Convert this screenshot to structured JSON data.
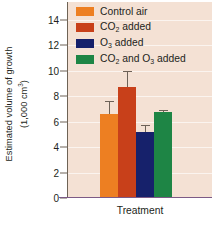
{
  "chart_data": {
    "type": "bar",
    "title": "",
    "xlabel": "Treatment",
    "ylabel_line1": "Estimated volume of growth",
    "ylabel_line2": "(1,000 cm3)",
    "ylabel_full": "Estimated volume of growth (1,000 cm³)",
    "categories": [
      "Control air",
      "CO2 added",
      "O3 added",
      "CO2 and O3 added"
    ],
    "values": [
      6.6,
      8.7,
      5.2,
      6.75
    ],
    "errors": [
      1.0,
      1.3,
      0.55,
      0.2
    ],
    "colors": [
      "#ED7F22",
      "#C8401A",
      "#16216B",
      "#1E8545"
    ],
    "ylim": [
      0,
      15.4
    ],
    "yticks": [
      0,
      2,
      4,
      6,
      8,
      10,
      12,
      14
    ],
    "ytick_labels": [
      "0",
      "2",
      "4",
      "6",
      "8",
      "10",
      "12",
      "14"
    ],
    "grid": true,
    "legend_position": "top-right",
    "plot_background": "#F4E1D4",
    "axis_color": "#6E6356",
    "xaxis_color": "#7C5A86"
  },
  "legend": {
    "entries": [
      {
        "label_pre": "Control air",
        "label_sub": "",
        "label_post": "",
        "color": "#ED7F22",
        "name": "control-air"
      },
      {
        "label_pre": "CO",
        "label_sub": "2",
        "label_post": " added",
        "color": "#C8401A",
        "name": "co2-added"
      },
      {
        "label_pre": "O",
        "label_sub": "3",
        "label_post": " added",
        "color": "#16216B",
        "name": "o3-added"
      },
      {
        "label_pre": "CO",
        "label_sub": "2",
        "label_post": " and O",
        "label_sub2": "3",
        "label_post2": " added",
        "color": "#1E8545",
        "name": "co2-and-o3-added"
      }
    ]
  },
  "axes": {
    "x_title": "Treatment",
    "y_title_line1": "Estimated volume of growth",
    "y_title_line2_pre": "(1,000 cm",
    "y_title_line2_sup": "3",
    "y_title_line2_post": ")"
  }
}
